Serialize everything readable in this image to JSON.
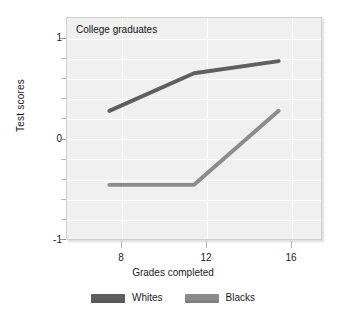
{
  "chart_data": {
    "type": "line",
    "title": "College graduates",
    "xlabel": "Grades completed",
    "ylabel": "Test scores",
    "x": [
      8,
      12,
      16
    ],
    "xtick_labels": [
      "8",
      "12",
      "16"
    ],
    "xlim": [
      6,
      18
    ],
    "ylim": [
      -1,
      1
    ],
    "ytick_labels": [
      "1",
      "0",
      "-1"
    ],
    "ytick_values": [
      1,
      0,
      -1
    ],
    "yminor_values": [
      0.8,
      0.6,
      0.4,
      0.2,
      -0.2,
      -0.4,
      -0.6,
      -0.8
    ],
    "grid": true,
    "legend_position": "bottom",
    "series": [
      {
        "name": "Whites",
        "color": "#5f5f5f",
        "values": [
          0.16,
          0.5,
          0.61
        ]
      },
      {
        "name": "Blacks",
        "color": "#8c8c8c",
        "values": [
          -0.51,
          -0.51,
          0.16
        ]
      }
    ]
  },
  "legend": {
    "items": [
      {
        "label": "Whites",
        "color": "#5f5f5f"
      },
      {
        "label": "Blacks",
        "color": "#8c8c8c"
      }
    ]
  },
  "colors": {
    "plot_background": "#f0f0f0",
    "gridline": "#ffffff",
    "frame": "#cfcfcf",
    "page_background": "#ffffff",
    "text": "#1a1a1a"
  }
}
